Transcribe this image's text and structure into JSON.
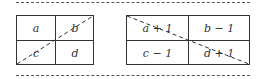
{
  "left_table": {
    "cells": [
      "a",
      "b",
      "c",
      "d"
    ],
    "diagonal": "bottom-left to top-right"
  },
  "right_table": {
    "cells": [
      "a + 1",
      "b − 1",
      "c − 1",
      "d + 1"
    ],
    "diagonal": "top-left to bottom-right"
  },
  "colors": {
    "line": "#333333",
    "dash": "#555555"
  }
}
